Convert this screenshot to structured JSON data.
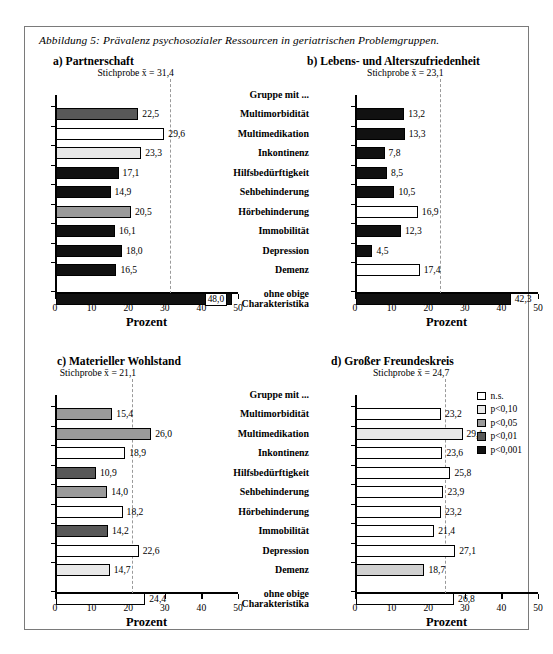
{
  "caption": "Abbildung 5: Prävalenz psychosozialer Ressourcen in geriatrischen Problemgruppen.",
  "group_header": "Gruppe mit ...",
  "row_labels": [
    "Multimorbidität",
    "Multimedikation",
    "Inkontinenz",
    "Hilfsbedürftigkeit",
    "Sehbehinderung",
    "Hörbehinderung",
    "Immobilität",
    "Depression",
    "Demenz",
    "ohne obige Charakteristika"
  ],
  "axis": {
    "title": "Prozent",
    "ticks": [
      "0",
      "10",
      "20",
      "30",
      "40",
      "50"
    ],
    "min": 0,
    "max": 50
  },
  "legend": {
    "items": [
      {
        "label": "n.s.",
        "color": "#ffffff"
      },
      {
        "label": "p<0,10",
        "color": "#e8e8e8"
      },
      {
        "label": "p<0,05",
        "color": "#9a9a9a"
      },
      {
        "label": "p<0,01",
        "color": "#585858"
      },
      {
        "label": "p<0,001",
        "color": "#111111"
      }
    ]
  },
  "chart_data": [
    {
      "type": "bar",
      "panel": "a",
      "panel_label": "a)",
      "title": "Partnerschaft",
      "mean_label": "Stichprobe x̄ = 31,4",
      "mean_value": 31.4,
      "xlabel": "Prozent",
      "ylabel": "",
      "xlim": [
        0,
        50
      ],
      "grid": false,
      "categories": [
        "Multimorbidität",
        "Multimedikation",
        "Inkontinenz",
        "Hilfsbedürftigkeit",
        "Sehbehinderung",
        "Hörbehinderung",
        "Immobilität",
        "Depression",
        "Demenz",
        "ohne obige Charakteristika"
      ],
      "values": [
        22.5,
        29.6,
        23.3,
        17.1,
        14.9,
        20.5,
        16.1,
        18.0,
        16.5,
        48.0
      ],
      "value_labels": [
        "22,5",
        "29,6",
        "23,3",
        "17,1",
        "14,9",
        "20,5",
        "16,1",
        "18,0",
        "16,5",
        "48,0"
      ],
      "significance": [
        "p<0,01",
        "n.s.",
        "p<0,10",
        "p<0,001",
        "p<0,001",
        "p<0,05",
        "p<0,001",
        "p<0,001",
        "p<0,001",
        "p<0,001"
      ],
      "colors": [
        "#585858",
        "#ffffff",
        "#e8e8e8",
        "#111111",
        "#111111",
        "#9a9a9a",
        "#111111",
        "#111111",
        "#111111",
        "#111111"
      ],
      "label_inside": [
        false,
        false,
        false,
        false,
        false,
        false,
        false,
        false,
        false,
        true
      ]
    },
    {
      "type": "bar",
      "panel": "b",
      "panel_label": "b)",
      "title": "Lebens- und Alterszufriedenheit",
      "mean_label": "Stichprobe x̄ = 23,1",
      "mean_value": 23.1,
      "xlabel": "Prozent",
      "ylabel": "",
      "xlim": [
        0,
        50
      ],
      "grid": false,
      "categories": [
        "Multimorbidität",
        "Multimedikation",
        "Inkontinenz",
        "Hilfsbedürftigkeit",
        "Sehbehinderung",
        "Hörbehinderung",
        "Immobilität",
        "Depression",
        "Demenz",
        "ohne obige Charakteristika"
      ],
      "values": [
        13.2,
        13.3,
        7.8,
        8.5,
        10.5,
        16.9,
        12.3,
        4.5,
        17.4,
        42.3
      ],
      "value_labels": [
        "13,2",
        "13,3",
        "7,8",
        "8,5",
        "10,5",
        "16,9",
        "12,3",
        "4,5",
        "17,4",
        "42,3"
      ],
      "significance": [
        "p<0,001",
        "p<0,001",
        "p<0,001",
        "p<0,001",
        "p<0,001",
        "n.s.",
        "p<0,001",
        "p<0,001",
        "n.s.",
        "p<0,001"
      ],
      "colors": [
        "#111111",
        "#111111",
        "#111111",
        "#111111",
        "#111111",
        "#ffffff",
        "#111111",
        "#111111",
        "#ffffff",
        "#111111"
      ],
      "label_inside": [
        false,
        false,
        false,
        false,
        false,
        false,
        false,
        false,
        false,
        false
      ]
    },
    {
      "type": "bar",
      "panel": "c",
      "panel_label": "c)",
      "title": "Materieller Wohlstand",
      "mean_label": "Stichprobe x̄ = 21,1",
      "mean_value": 21.1,
      "xlabel": "Prozent",
      "ylabel": "",
      "xlim": [
        0,
        50
      ],
      "grid": false,
      "categories": [
        "Multimorbidität",
        "Multimedikation",
        "Inkontinenz",
        "Hilfsbedürftigkeit",
        "Sehbehinderung",
        "Hörbehinderung",
        "Immobilität",
        "Depression",
        "Demenz",
        "ohne obige Charakteristika"
      ],
      "values": [
        15.4,
        26.0,
        18.9,
        10.9,
        14.0,
        18.2,
        14.2,
        22.6,
        14.7,
        24.4
      ],
      "value_labels": [
        "15,4",
        "26,0",
        "18,9",
        "10,9",
        "14,0",
        "18,2",
        "14,2",
        "22,6",
        "14,7",
        "24,4"
      ],
      "significance": [
        "p<0,05",
        "p<0,05",
        "n.s.",
        "p<0,01",
        "p<0,05",
        "n.s.",
        "p<0,01",
        "n.s.",
        "p<0,10",
        "n.s."
      ],
      "colors": [
        "#9a9a9a",
        "#9a9a9a",
        "#ffffff",
        "#585858",
        "#9a9a9a",
        "#ffffff",
        "#585858",
        "#ffffff",
        "#e8e8e8",
        "#ffffff"
      ],
      "label_inside": [
        false,
        false,
        false,
        false,
        false,
        false,
        false,
        false,
        false,
        false
      ]
    },
    {
      "type": "bar",
      "panel": "d",
      "panel_label": "d)",
      "title": "Großer Freundeskreis",
      "mean_label": "Stichprobe x̄ = 24,7",
      "mean_value": 24.7,
      "xlabel": "Prozent",
      "ylabel": "",
      "xlim": [
        0,
        50
      ],
      "grid": false,
      "categories": [
        "Multimorbidität",
        "Multimedikation",
        "Inkontinenz",
        "Hilfsbedürftigkeit",
        "Sehbehinderung",
        "Hörbehinderung",
        "Immobilität",
        "Depression",
        "Demenz",
        "ohne obige Charakteristika"
      ],
      "values": [
        23.2,
        29.1,
        23.6,
        25.8,
        23.9,
        23.2,
        21.4,
        27.1,
        18.7,
        26.8
      ],
      "value_labels": [
        "23,2",
        "29,1",
        "23,6",
        "25,8",
        "23,9",
        "23,2",
        "21,4",
        "27,1",
        "18,7",
        "26,8"
      ],
      "significance": [
        "n.s.",
        "p<0,10",
        "n.s.",
        "n.s.",
        "n.s.",
        "n.s.",
        "n.s.",
        "n.s.",
        "p<0,05",
        "n.s."
      ],
      "colors": [
        "#ffffff",
        "#e8e8e8",
        "#ffffff",
        "#ffffff",
        "#ffffff",
        "#ffffff",
        "#ffffff",
        "#ffffff",
        "#d0d0d0",
        "#ffffff"
      ],
      "label_inside": [
        false,
        false,
        false,
        false,
        false,
        false,
        false,
        false,
        false,
        false
      ]
    }
  ]
}
